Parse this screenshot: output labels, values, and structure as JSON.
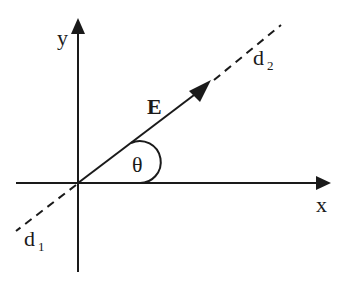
{
  "diagram": {
    "type": "vector-angle-diagram",
    "colors": {
      "ink": "#1a1a1a",
      "background": "#ffffff"
    },
    "axes": {
      "x_label": "x",
      "y_label": "y"
    },
    "vector": {
      "label": "E",
      "style": "bold"
    },
    "angle": {
      "label": "θ"
    },
    "lines": {
      "d1": {
        "main": "d",
        "sub": "1"
      },
      "d2": {
        "main": "d",
        "sub": "2"
      }
    }
  }
}
